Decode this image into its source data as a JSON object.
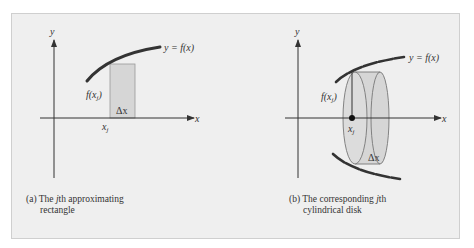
{
  "colors": {
    "panel_bg": "#efefef",
    "panel_border": "#cfcfcf",
    "curve": "#333333",
    "axis": "#333333",
    "shaded": "#d6d6d6",
    "shaded_stroke": "#888888",
    "text": "#333333"
  },
  "left_diagram": {
    "y_axis_label": "y",
    "x_axis_label": "x",
    "curve_label": "y = f(x)",
    "height_label": "f(x",
    "height_label_sub": "j",
    "height_label_close": ")",
    "width_label": "Δx",
    "xj_label": "x",
    "xj_sub": "j",
    "caption_line1_prefix": "(a) The ",
    "caption_line1_italic": "j",
    "caption_line1_suffix": "th approximating",
    "caption_line2": "rectangle"
  },
  "right_diagram": {
    "y_axis_label": "y",
    "x_axis_label": "x",
    "curve_label": "y = f(x)",
    "height_label": "f(x",
    "height_label_sub": "j",
    "height_label_close": ")",
    "width_label": "Δx",
    "xj_label": "x",
    "xj_sub": "j",
    "caption_line1_prefix": "(b) The corresponding ",
    "caption_line1_italic": "j",
    "caption_line1_suffix": "th",
    "caption_line2": "cylindrical disk"
  }
}
